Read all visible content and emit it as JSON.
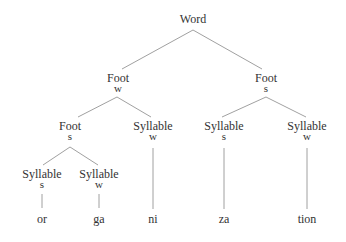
{
  "diagram": {
    "type": "prosodic tree",
    "line_color": "#888888",
    "text_color": "#333333",
    "root": {
      "label": "Word"
    },
    "feet": [
      {
        "label": "Foot",
        "stress": "w"
      },
      {
        "label": "Foot",
        "stress": "s"
      }
    ],
    "inner_nodes": [
      {
        "label": "Foot",
        "stress": "s"
      },
      {
        "label": "Syllable",
        "stress": "w"
      },
      {
        "label": "Syllable",
        "stress": "s"
      },
      {
        "label": "Syllable",
        "stress": "w"
      }
    ],
    "lower_nodes": [
      {
        "label": "Syllable",
        "stress": "s"
      },
      {
        "label": "Syllable",
        "stress": "w"
      }
    ],
    "segments": [
      "or",
      "ga",
      "ni",
      "za",
      "tion"
    ]
  }
}
